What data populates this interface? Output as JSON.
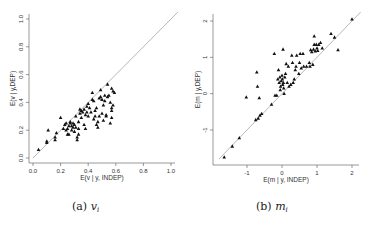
{
  "chart_data": [
    {
      "type": "scatter",
      "panel": "a",
      "caption_prefix": "(a)",
      "caption_var": "v",
      "caption_sub": "i",
      "xlabel": "E(v | y, INDEP)",
      "ylabel": "E(v | y,DEP)",
      "xlim": [
        0,
        1.0
      ],
      "ylim": [
        0,
        1.0
      ],
      "xticks": [
        "0.0",
        "0.2",
        "0.4",
        "0.6",
        "0.8",
        "1.0"
      ],
      "yticks": [
        "0.0",
        "0.2",
        "0.4",
        "0.6",
        "0.8",
        "1.0"
      ],
      "reference_line": "y = x",
      "grid": false,
      "marker": "triangle",
      "points": [
        [
          0.04,
          0.06
        ],
        [
          0.1,
          0.12
        ],
        [
          0.1,
          0.11
        ],
        [
          0.11,
          0.2
        ],
        [
          0.16,
          0.13
        ],
        [
          0.16,
          0.15
        ],
        [
          0.17,
          0.18
        ],
        [
          0.2,
          0.29
        ],
        [
          0.22,
          0.21
        ],
        [
          0.23,
          0.24
        ],
        [
          0.24,
          0.25
        ],
        [
          0.24,
          0.2
        ],
        [
          0.25,
          0.17
        ],
        [
          0.25,
          0.21
        ],
        [
          0.26,
          0.17
        ],
        [
          0.26,
          0.23
        ],
        [
          0.27,
          0.25
        ],
        [
          0.27,
          0.26
        ],
        [
          0.28,
          0.23
        ],
        [
          0.28,
          0.2
        ],
        [
          0.29,
          0.22
        ],
        [
          0.29,
          0.25
        ],
        [
          0.3,
          0.24
        ],
        [
          0.3,
          0.19
        ],
        [
          0.31,
          0.22
        ],
        [
          0.31,
          0.3
        ],
        [
          0.32,
          0.15
        ],
        [
          0.32,
          0.13
        ],
        [
          0.33,
          0.17
        ],
        [
          0.33,
          0.21
        ],
        [
          0.33,
          0.26
        ],
        [
          0.34,
          0.32
        ],
        [
          0.34,
          0.35
        ],
        [
          0.35,
          0.34
        ],
        [
          0.35,
          0.29
        ],
        [
          0.36,
          0.33
        ],
        [
          0.37,
          0.24
        ],
        [
          0.37,
          0.35
        ],
        [
          0.38,
          0.31
        ],
        [
          0.38,
          0.21
        ],
        [
          0.39,
          0.37
        ],
        [
          0.39,
          0.33
        ],
        [
          0.4,
          0.39
        ],
        [
          0.4,
          0.3
        ],
        [
          0.41,
          0.36
        ],
        [
          0.42,
          0.33
        ],
        [
          0.43,
          0.47
        ],
        [
          0.43,
          0.42
        ],
        [
          0.44,
          0.28
        ],
        [
          0.44,
          0.41
        ],
        [
          0.45,
          0.3
        ],
        [
          0.45,
          0.34
        ],
        [
          0.46,
          0.36
        ],
        [
          0.46,
          0.24
        ],
        [
          0.47,
          0.22
        ],
        [
          0.47,
          0.26
        ],
        [
          0.48,
          0.43
        ],
        [
          0.48,
          0.3
        ],
        [
          0.49,
          0.49
        ],
        [
          0.49,
          0.44
        ],
        [
          0.5,
          0.42
        ],
        [
          0.5,
          0.32
        ],
        [
          0.51,
          0.38
        ],
        [
          0.51,
          0.27
        ],
        [
          0.52,
          0.41
        ],
        [
          0.52,
          0.45
        ],
        [
          0.53,
          0.3
        ],
        [
          0.53,
          0.31
        ],
        [
          0.54,
          0.44
        ],
        [
          0.54,
          0.53
        ],
        [
          0.55,
          0.45
        ],
        [
          0.56,
          0.4
        ],
        [
          0.56,
          0.25
        ],
        [
          0.57,
          0.36
        ],
        [
          0.57,
          0.34
        ],
        [
          0.57,
          0.5
        ],
        [
          0.58,
          0.48
        ],
        [
          0.58,
          0.38
        ],
        [
          0.59,
          0.47
        ],
        [
          0.57,
          0.29
        ]
      ]
    },
    {
      "type": "scatter",
      "panel": "b",
      "caption_prefix": "(b)",
      "caption_var": "m",
      "caption_sub": "i",
      "xlabel": "E(m | y, INDEP)",
      "ylabel": "E(m | y,DEP)",
      "xlim": [
        -1.8,
        2.2
      ],
      "ylim": [
        -1.9,
        2.2
      ],
      "xticks": [
        "-1",
        "0",
        "1",
        "2"
      ],
      "yticks": [
        "-1",
        "0",
        "1",
        "2"
      ],
      "reference_line": "y = x",
      "grid": false,
      "marker": "triangle",
      "points": [
        [
          -1.65,
          -1.75
        ],
        [
          -1.42,
          -1.45
        ],
        [
          -1.22,
          -1.22
        ],
        [
          -1.02,
          -0.1
        ],
        [
          -0.75,
          -0.72
        ],
        [
          -0.72,
          0.59
        ],
        [
          -0.7,
          0.2
        ],
        [
          -0.68,
          -0.68
        ],
        [
          -0.65,
          -0.12
        ],
        [
          -0.63,
          -0.6
        ],
        [
          -0.58,
          -0.55
        ],
        [
          -0.3,
          -0.3
        ],
        [
          -0.22,
          1.1
        ],
        [
          -0.2,
          -0.05
        ],
        [
          -0.15,
          -0.05
        ],
        [
          -0.12,
          0.4
        ],
        [
          -0.1,
          0.65
        ],
        [
          -0.08,
          0.3
        ],
        [
          -0.06,
          0.45
        ],
        [
          -0.05,
          0.1
        ],
        [
          -0.04,
          0.2
        ],
        [
          -0.02,
          0.35
        ],
        [
          0.0,
          0.5
        ],
        [
          0.01,
          0.4
        ],
        [
          0.02,
          0.25
        ],
        [
          0.03,
          1.22
        ],
        [
          0.04,
          0.3
        ],
        [
          0.05,
          0.15
        ],
        [
          0.06,
          0.0
        ],
        [
          0.08,
          0.45
        ],
        [
          0.1,
          0.55
        ],
        [
          0.12,
          0.82
        ],
        [
          0.15,
          0.3
        ],
        [
          0.18,
          0.75
        ],
        [
          0.2,
          0.2
        ],
        [
          0.25,
          0.25
        ],
        [
          0.28,
          1.05
        ],
        [
          0.3,
          0.85
        ],
        [
          0.32,
          0.3
        ],
        [
          0.35,
          0.4
        ],
        [
          0.38,
          0.65
        ],
        [
          0.4,
          0.75
        ],
        [
          0.42,
          1.05
        ],
        [
          0.48,
          0.55
        ],
        [
          0.5,
          0.85
        ],
        [
          0.52,
          1.1
        ],
        [
          0.55,
          0.7
        ],
        [
          0.6,
          1.1
        ],
        [
          0.62,
          0.75
        ],
        [
          0.7,
          0.75
        ],
        [
          0.78,
          0.85
        ],
        [
          0.8,
          0.75
        ],
        [
          0.82,
          1.2
        ],
        [
          0.85,
          1.15
        ],
        [
          0.88,
          0.8
        ],
        [
          0.9,
          1.22
        ],
        [
          0.92,
          1.35
        ],
        [
          0.92,
          1.58
        ],
        [
          0.95,
          1.17
        ],
        [
          0.98,
          1.35
        ],
        [
          1.0,
          1.25
        ],
        [
          1.02,
          1.18
        ],
        [
          1.05,
          1.35
        ],
        [
          1.1,
          1.4
        ],
        [
          1.15,
          1.25
        ],
        [
          1.4,
          1.65
        ],
        [
          1.5,
          1.55
        ],
        [
          1.6,
          1.2
        ],
        [
          2.0,
          2.05
        ]
      ]
    }
  ]
}
